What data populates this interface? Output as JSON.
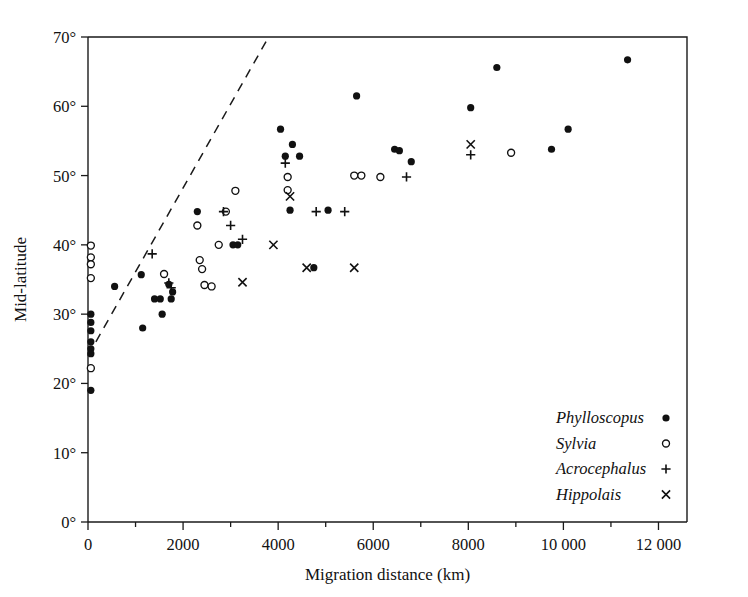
{
  "figure": {
    "y_axis_label": "Mid-latitude",
    "x_axis_label": "Migration distance (km)"
  },
  "legend": {
    "items": [
      {
        "name": "Phylloscopus",
        "marker": "filled-circle-icon"
      },
      {
        "name": "Sylvia",
        "marker": "open-circle-icon"
      },
      {
        "name": "Acrocephalus",
        "marker": "plus-icon"
      },
      {
        "name": "Hippolais",
        "marker": "cross-icon"
      }
    ]
  },
  "chart_data": {
    "type": "scatter",
    "title": "",
    "xlabel": "Migration distance (km)",
    "ylabel": "Mid-latitude",
    "xlim": [
      0,
      12600
    ],
    "ylim": [
      0,
      70
    ],
    "xticks": [
      0,
      2000,
      4000,
      6000,
      8000,
      10000,
      12000
    ],
    "xticklabels": [
      "0",
      "2000",
      "4000",
      "6000",
      "8000",
      "10 000",
      "12 000"
    ],
    "xminorticks": [
      1000,
      3000,
      5000,
      7000,
      9000,
      11000
    ],
    "yticks": [
      0,
      10,
      20,
      30,
      40,
      50,
      60,
      70
    ],
    "yticklabels": [
      "0°",
      "10°",
      "20°",
      "30°",
      "40°",
      "50°",
      "60°",
      "70°"
    ],
    "grid": false,
    "legend_position": "bottom-right",
    "annotations": [
      {
        "type": "dashed-line",
        "name": "upper-bound-trend",
        "x": [
          0,
          3800
        ],
        "y": [
          24.0,
          70.0
        ]
      }
    ],
    "series": [
      {
        "name": "Phylloscopus",
        "marker": "filled-circle",
        "points": [
          [
            60,
            30.0
          ],
          [
            60,
            28.8
          ],
          [
            60,
            27.6
          ],
          [
            60,
            26.0
          ],
          [
            60,
            25.0
          ],
          [
            60,
            24.3
          ],
          [
            60,
            19.0
          ],
          [
            560,
            34.0
          ],
          [
            1120,
            35.7
          ],
          [
            1150,
            28.0
          ],
          [
            1400,
            32.2
          ],
          [
            1520,
            32.2
          ],
          [
            1560,
            30.0
          ],
          [
            1700,
            34.3
          ],
          [
            1750,
            32.2
          ],
          [
            1780,
            33.2
          ],
          [
            2300,
            44.8
          ],
          [
            3050,
            40.0
          ],
          [
            3150,
            40.0
          ],
          [
            4050,
            56.7
          ],
          [
            4150,
            52.8
          ],
          [
            4300,
            54.5
          ],
          [
            4450,
            52.8
          ],
          [
            4250,
            45.0
          ],
          [
            5050,
            45.0
          ],
          [
            5650,
            61.5
          ],
          [
            6450,
            53.8
          ],
          [
            6550,
            53.6
          ],
          [
            6800,
            52.0
          ],
          [
            8050,
            59.8
          ],
          [
            8600,
            65.6
          ],
          [
            9750,
            53.8
          ],
          [
            10100,
            56.7
          ],
          [
            11350,
            66.7
          ],
          [
            4750,
            36.7
          ]
        ]
      },
      {
        "name": "Sylvia",
        "marker": "open-circle",
        "points": [
          [
            60,
            39.9
          ],
          [
            60,
            38.2
          ],
          [
            60,
            37.2
          ],
          [
            60,
            35.2
          ],
          [
            60,
            22.2
          ],
          [
            1600,
            35.8
          ],
          [
            2300,
            42.8
          ],
          [
            2350,
            37.8
          ],
          [
            2400,
            36.5
          ],
          [
            2450,
            34.2
          ],
          [
            2600,
            34.0
          ],
          [
            2900,
            44.8
          ],
          [
            3100,
            47.8
          ],
          [
            2750,
            40.0
          ],
          [
            4200,
            47.9
          ],
          [
            4200,
            49.8
          ],
          [
            5600,
            50.0
          ],
          [
            5750,
            50.0
          ],
          [
            6150,
            49.8
          ],
          [
            8900,
            53.3
          ]
        ]
      },
      {
        "name": "Acrocephalus",
        "marker": "plus",
        "points": [
          [
            1350,
            38.7
          ],
          [
            1700,
            34.5
          ],
          [
            1750,
            33.8
          ],
          [
            2850,
            44.8
          ],
          [
            3000,
            42.8
          ],
          [
            3250,
            40.8
          ],
          [
            4150,
            51.8
          ],
          [
            4800,
            44.8
          ],
          [
            5400,
            44.8
          ],
          [
            6700,
            49.8
          ],
          [
            8050,
            53.0
          ]
        ]
      },
      {
        "name": "Hippolais",
        "marker": "cross",
        "points": [
          [
            3250,
            34.6
          ],
          [
            3900,
            40.0
          ],
          [
            4250,
            47.0
          ],
          [
            4600,
            36.7
          ],
          [
            5600,
            36.7
          ],
          [
            8050,
            54.5
          ]
        ]
      }
    ]
  }
}
